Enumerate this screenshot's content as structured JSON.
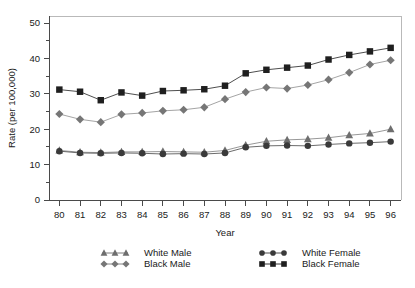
{
  "chart_data": {
    "type": "line",
    "title": "",
    "xlabel": "Year",
    "ylabel": "Rate (per 100,000)",
    "x": [
      80,
      81,
      82,
      83,
      84,
      85,
      86,
      87,
      88,
      89,
      90,
      91,
      92,
      93,
      94,
      95,
      96
    ],
    "xticklabels": [
      "80",
      "81",
      "82",
      "83",
      "84",
      "85",
      "86",
      "87",
      "88",
      "89",
      "90",
      "91",
      "92",
      "93",
      "94",
      "95",
      "96"
    ],
    "yticks": [
      0,
      10,
      20,
      30,
      40,
      50
    ],
    "yticklabels": [
      "0",
      "10",
      "20",
      "30",
      "40",
      "50"
    ],
    "xlim": [
      79.5,
      96.5
    ],
    "ylim": [
      0,
      52
    ],
    "grid": false,
    "legend_position": "below-axes",
    "series": [
      {
        "name": "White Male",
        "marker": "triangle",
        "color": "#6e6e6e",
        "line_color": "#8c8c8c",
        "values": [
          14.0,
          13.5,
          13.4,
          13.6,
          13.6,
          13.7,
          13.6,
          13.5,
          14.0,
          15.5,
          16.6,
          17.0,
          17.2,
          17.6,
          18.3,
          18.8,
          20.0
        ]
      },
      {
        "name": "Black Male",
        "marker": "diamond",
        "color": "#767676",
        "line_color": "#9a9a9a",
        "values": [
          24.3,
          22.8,
          22.0,
          24.2,
          24.6,
          25.2,
          25.5,
          26.2,
          28.5,
          30.5,
          31.8,
          31.5,
          32.5,
          34.0,
          36.0,
          38.3,
          39.5
        ]
      },
      {
        "name": "White Female",
        "marker": "circle",
        "color": "#3a3a3a",
        "line_color": "#5a5a5a",
        "values": [
          13.8,
          13.3,
          13.2,
          13.3,
          13.2,
          13.0,
          13.1,
          13.0,
          13.3,
          14.9,
          15.3,
          15.4,
          15.3,
          15.7,
          16.0,
          16.2,
          16.5
        ]
      },
      {
        "name": "Black Female",
        "marker": "square",
        "color": "#1f1f1f",
        "line_color": "#3a3a3a",
        "values": [
          31.2,
          30.6,
          28.2,
          30.4,
          29.5,
          30.8,
          31.0,
          31.3,
          32.3,
          35.8,
          36.8,
          37.4,
          38.0,
          39.7,
          41.0,
          42.0,
          43.0
        ]
      }
    ],
    "legend": [
      {
        "label": "White Male",
        "marker": "triangle",
        "color": "#6e6e6e"
      },
      {
        "label": "Black Male",
        "marker": "diamond",
        "color": "#767676"
      },
      {
        "label": "White Female",
        "marker": "circle",
        "color": "#3a3a3a"
      },
      {
        "label": "Black Female",
        "marker": "square",
        "color": "#1f1f1f"
      }
    ]
  },
  "footnote": {
    "text": ""
  }
}
